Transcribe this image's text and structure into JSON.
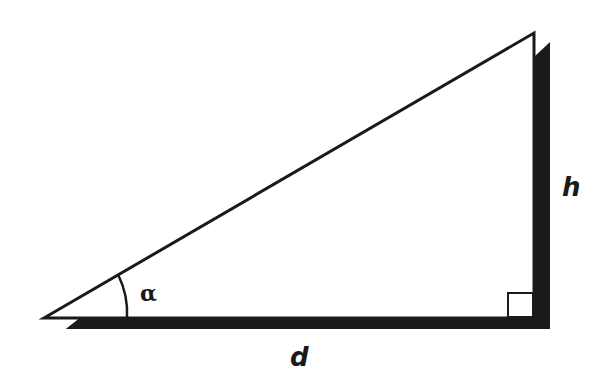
{
  "diagram": {
    "colors": {
      "background": "#ffffff",
      "stroke": "#1a1a1a",
      "shadow": "#1a1a1a"
    },
    "vertices": {
      "left_apex": [
        44,
        318
      ],
      "top_apex": [
        534,
        33
      ],
      "right_angle_corner": [
        534,
        318
      ]
    },
    "labels": {
      "angle": "α",
      "height": "h",
      "distance": "d"
    },
    "right_angle_marker": true
  }
}
